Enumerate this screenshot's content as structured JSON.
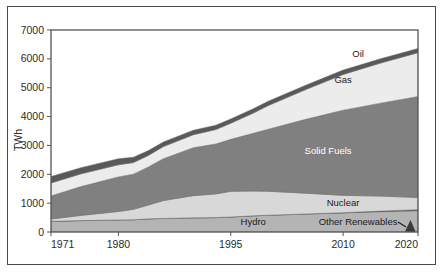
{
  "chart_data": {
    "type": "area",
    "stacked": true,
    "title": "",
    "subtitle": "",
    "xlabel": "",
    "ylabel": "TWh",
    "xlim": [
      1971,
      2020
    ],
    "ylim": [
      0,
      7000
    ],
    "ytick_labels": [
      "0",
      "1000",
      "2000",
      "3000",
      "4000",
      "5000",
      "6000",
      "7000"
    ],
    "ytick_values": [
      0,
      1000,
      2000,
      3000,
      4000,
      5000,
      6000,
      7000
    ],
    "xtick_labels": [
      "1971",
      "1980",
      "1995",
      "2010",
      "2020"
    ],
    "xtick_values": [
      1971,
      1980,
      1995,
      2010,
      2020
    ],
    "grid": false,
    "legend_position": "inline-annotations",
    "x": [
      1971,
      1975,
      1980,
      1982,
      1984,
      1986,
      1990,
      1993,
      1995,
      1998,
      2000,
      2005,
      2010,
      2015,
      2020
    ],
    "series": [
      {
        "name": "Hydro",
        "color": "#b4b4b4",
        "values": [
          370,
          395,
          420,
          425,
          455,
          470,
          490,
          500,
          520,
          560,
          580,
          620,
          660,
          705,
          740
        ]
      },
      {
        "name": "Other Renewables",
        "color": "#4a4a4a",
        "values": [
          0,
          0,
          0,
          0,
          0,
          0,
          0,
          0,
          0,
          0,
          2,
          5,
          10,
          20,
          35
        ]
      },
      {
        "name": "Nuclear",
        "color": "#d8d8d8",
        "values": [
          80,
          180,
          290,
          360,
          480,
          620,
          770,
          820,
          890,
          860,
          830,
          720,
          600,
          520,
          420
        ]
      },
      {
        "name": "Solid Fuels",
        "color": "#808080",
        "values": [
          800,
          1000,
          1200,
          1220,
          1320,
          1450,
          1660,
          1730,
          1800,
          2000,
          2150,
          2560,
          2950,
          3220,
          3500
        ]
      },
      {
        "name": "Gas",
        "color": "#ececec",
        "values": [
          450,
          440,
          420,
          400,
          400,
          420,
          450,
          500,
          560,
          700,
          820,
          1030,
          1240,
          1390,
          1520
        ]
      },
      {
        "name": "Oil",
        "color": "#595959",
        "values": [
          220,
          215,
          210,
          185,
          165,
          160,
          155,
          150,
          150,
          150,
          150,
          150,
          150,
          148,
          145
        ]
      }
    ],
    "totals": [
      1920,
      2230,
      2540,
      2590,
      2820,
      3120,
      3525,
      3700,
      3920,
      4270,
      4532,
      5085,
      5610,
      5983,
      6360
    ],
    "annotations": [
      {
        "label": "Oil",
        "x": 2012,
        "y": 6060,
        "style": "dark"
      },
      {
        "label": "Gas",
        "x": 2010,
        "y": 5150,
        "style": "dark"
      },
      {
        "label": "Solid Fuels",
        "x": 2008,
        "y": 2700,
        "style": "light"
      },
      {
        "label": "Nuclear",
        "x": 2010,
        "y": 900,
        "style": "dark"
      },
      {
        "label": "Hydro",
        "x": 1998,
        "y": 230,
        "style": "dark"
      },
      {
        "label": "Other Renewables",
        "x": 2012,
        "y": 230,
        "style": "dark"
      }
    ],
    "pointer": {
      "from_label": "Other Renewables",
      "to_marker": "other-renewables-wedge"
    }
  }
}
